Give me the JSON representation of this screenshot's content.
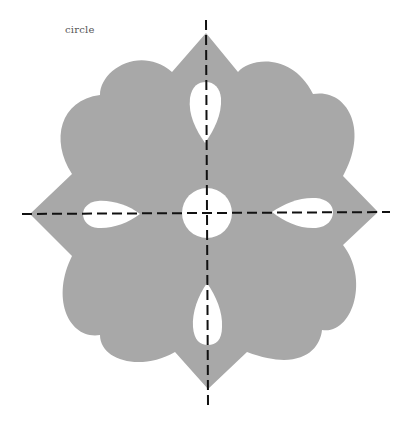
{
  "diagram": {
    "label": "circle",
    "colors": {
      "shape_fill": "#a8a8a8",
      "cutout_fill": "#ffffff",
      "axis_stroke": "#111111",
      "label_color": "#555555"
    },
    "elements": {
      "outer_shape": "four-pointed rosette with scalloped lobes",
      "cutouts": [
        "top-teardrop",
        "right-teardrop",
        "bottom-teardrop",
        "left-teardrop",
        "center-circle"
      ],
      "axes": [
        "vertical-dashed-axis",
        "horizontal-dashed-axis"
      ]
    }
  }
}
